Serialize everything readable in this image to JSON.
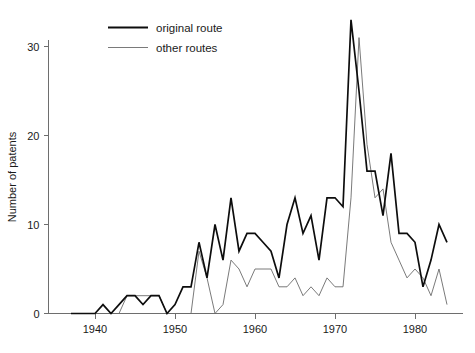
{
  "chart_data": {
    "type": "line",
    "title": "",
    "xlabel": "",
    "ylabel": "Number of patents",
    "xlim": [
      1936,
      1985
    ],
    "ylim": [
      0,
      35
    ],
    "grid": false,
    "legend_position": "top-left",
    "x_ticks": [
      1940,
      1950,
      1960,
      1970,
      1980
    ],
    "x_tick_labels": [
      "1940",
      "1950",
      "1960",
      "1970",
      "1980"
    ],
    "y_ticks": [
      0,
      10,
      20,
      30
    ],
    "y_tick_labels": [
      "0",
      "10",
      "20",
      "30"
    ],
    "x": [
      1937,
      1938,
      1939,
      1940,
      1941,
      1942,
      1943,
      1944,
      1945,
      1946,
      1947,
      1948,
      1949,
      1950,
      1951,
      1952,
      1953,
      1954,
      1955,
      1956,
      1957,
      1958,
      1959,
      1960,
      1961,
      1962,
      1963,
      1964,
      1965,
      1966,
      1967,
      1968,
      1969,
      1970,
      1971,
      1972,
      1973,
      1974,
      1975,
      1976,
      1977,
      1978,
      1979,
      1980,
      1981,
      1982,
      1983,
      1984
    ],
    "series": [
      {
        "name": "original route",
        "color": "#0d0d0d",
        "values": [
          0,
          0,
          0,
          0,
          1,
          0,
          1,
          2,
          2,
          1,
          2,
          2,
          0,
          1,
          3,
          3,
          8,
          4,
          10,
          6,
          13,
          7,
          9,
          9,
          8,
          7,
          4,
          10,
          13,
          9,
          11,
          6,
          13,
          13,
          12,
          33,
          25,
          16,
          16,
          11,
          18,
          9,
          9,
          8,
          3,
          6,
          10,
          8
        ]
      },
      {
        "name": "other routes",
        "color": "#6b6b6b",
        "values": [
          0,
          0,
          0,
          0,
          0,
          0,
          0,
          2,
          2,
          2,
          2,
          2,
          0,
          0,
          0,
          0,
          7,
          4,
          0,
          1,
          6,
          5,
          3,
          5,
          5,
          5,
          3,
          3,
          4,
          2,
          3,
          2,
          4,
          3,
          3,
          13,
          31,
          19,
          13,
          14,
          8,
          6,
          4,
          5,
          4,
          2,
          5,
          1
        ]
      }
    ]
  },
  "legend": {
    "items": [
      {
        "label": "original route"
      },
      {
        "label": "other routes"
      }
    ]
  },
  "axes": {
    "y_title": "Number of patents"
  }
}
